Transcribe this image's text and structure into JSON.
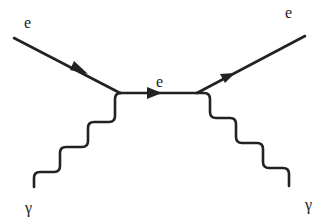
{
  "diagram": {
    "type": "feynman",
    "process": "Compton scattering",
    "colors": {
      "line": "#222222",
      "background": "#ffffff"
    },
    "labels": {
      "incoming_electron": "e",
      "internal_electron": "e",
      "outgoing_electron": "e",
      "incoming_photon": "γ",
      "outgoing_photon": "γ"
    },
    "vertices": [
      {
        "id": "v1",
        "x": 120,
        "y": 93
      },
      {
        "id": "v2",
        "x": 197,
        "y": 93
      }
    ],
    "propagators": [
      {
        "id": "incoming-electron",
        "kind": "fermion",
        "from": [
          14,
          38
        ],
        "to": "v1",
        "arrow": true
      },
      {
        "id": "internal-electron",
        "kind": "fermion",
        "from": "v1",
        "to": "v2",
        "arrow": true
      },
      {
        "id": "outgoing-electron",
        "kind": "fermion",
        "from": "v2",
        "to": [
          305,
          36
        ],
        "arrow": true
      },
      {
        "id": "incoming-photon",
        "kind": "photon",
        "from": [
          34,
          187
        ],
        "to": "v1"
      },
      {
        "id": "outgoing-photon",
        "kind": "photon",
        "from": "v2",
        "to": [
          289,
          186
        ]
      }
    ]
  }
}
